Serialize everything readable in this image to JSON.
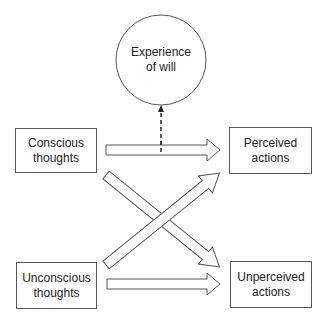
{
  "diagram": {
    "will_node": {
      "line1": "Experience",
      "line2": "of will"
    },
    "nodes": {
      "conscious_thoughts": {
        "line1": "Conscious",
        "line2": "thoughts"
      },
      "unconscious_thoughts": {
        "line1": "Unconscious",
        "line2": "thoughts"
      },
      "perceived_actions": {
        "line1": "Perceived",
        "line2": "actions"
      },
      "unperceived_actions": {
        "line1": "Unperceived",
        "line2": "actions"
      }
    },
    "edges": [
      {
        "from": "Conscious thoughts",
        "to": "Perceived actions",
        "style": "hollow-arrow"
      },
      {
        "from": "Conscious thoughts",
        "to": "Unperceived actions",
        "style": "hollow-arrow"
      },
      {
        "from": "Unconscious thoughts",
        "to": "Perceived actions",
        "style": "hollow-arrow"
      },
      {
        "from": "Unconscious thoughts",
        "to": "Unperceived actions",
        "style": "hollow-arrow"
      },
      {
        "from": "Conscious thoughts → Perceived actions",
        "to": "Experience of will",
        "style": "dashed-arrow"
      }
    ],
    "colors": {
      "stroke": "#555555",
      "background": "#ffffff",
      "text": "#222222"
    }
  }
}
